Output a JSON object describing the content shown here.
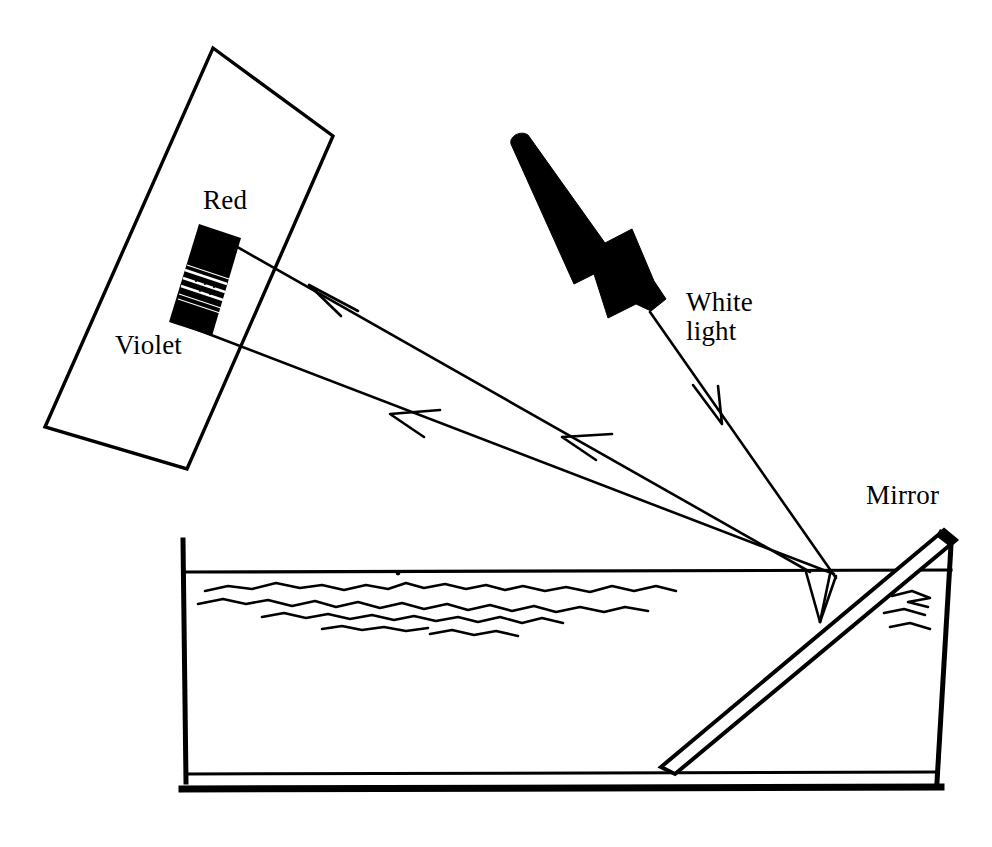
{
  "figure": {
    "kind": "optics-diagram",
    "background_color": "#ffffff",
    "ink_color": "#000000",
    "width": 992,
    "height": 847
  },
  "labels": {
    "red": "Red",
    "violet": "Violet",
    "white_light": "White\nlight",
    "white_light_line1": "White",
    "white_light_line2": "light",
    "mirror": "Mirror"
  },
  "components": {
    "screen": {
      "name": "screen-card",
      "description": "tilted blank rectangular screen at upper left",
      "corners": [
        [
          213,
          48
        ],
        [
          333,
          136
        ],
        [
          187,
          469
        ],
        [
          45,
          427
        ]
      ],
      "stroke_width": 3
    },
    "spectrum": {
      "name": "spectrum-band",
      "description": "dark band on the screen showing the dispersed spectrum from Red at top to Violet at bottom",
      "corners": [
        [
          200,
          226
        ],
        [
          240,
          239
        ],
        [
          211,
          334
        ],
        [
          170,
          321
        ]
      ],
      "fill": "#000000",
      "striations": 5,
      "top_end_label": "Red",
      "bottom_end_label": "Violet"
    },
    "lamp": {
      "name": "light-source-arrow",
      "description": "solid black tapered beam arrow representing the incident white light source",
      "tail": [
        524,
        138
      ],
      "head": [
        650,
        316
      ],
      "fill": "#000000"
    },
    "tank": {
      "name": "water-tank",
      "description": "rectangular container of water drawn in side view",
      "left_wall_x": 182,
      "right_wall_top_x": 950,
      "right_wall_bottom_x": 936,
      "rim_y": 540,
      "water_surface_y": 572,
      "bottom_inner_y": 774,
      "bottom_outer_y": 791,
      "stroke_width": 4
    },
    "water": {
      "name": "water-surface-ripples",
      "description": "hand-drawn wavy lines just below the water surface line",
      "ripple_rows": 4
    },
    "mirror": {
      "name": "mirror-slab",
      "description": "flat mirror leaning at about 45 degrees inside the tank, top edge above the water line",
      "top": [
        948,
        533
      ],
      "bottom": [
        663,
        768
      ],
      "thickness": 12
    }
  },
  "rays": [
    {
      "name": "incident-white-light-ray",
      "from": [
        650,
        316
      ],
      "to": [
        828,
        572
      ],
      "arrow_at": [
        718,
        418
      ],
      "arrow_direction": "down-right",
      "color": "#000000"
    },
    {
      "name": "refracted-ray-in-water",
      "from": [
        828,
        572
      ],
      "to": [
        822,
        620
      ],
      "color": "#000000"
    },
    {
      "name": "reflected-ray-to-surface-upper",
      "from": [
        822,
        620
      ],
      "to": [
        808,
        572
      ],
      "color": "#000000"
    },
    {
      "name": "emergent-red-ray",
      "from": [
        808,
        572
      ],
      "to": [
        202,
        226
      ],
      "arrow_at": [
        312,
        287
      ],
      "arrow_direction": "up-left",
      "terminates_at": "Red end of spectrum",
      "color": "#000000"
    },
    {
      "name": "emergent-violet-ray",
      "from": [
        828,
        572
      ],
      "to": [
        176,
        318
      ],
      "arrow_at_1": [
        565,
        437
      ],
      "arrow_at_2": [
        393,
        414
      ],
      "arrow_direction": "up-left",
      "terminates_at": "Violet end of spectrum",
      "color": "#000000"
    }
  ],
  "colors": {
    "ink": "#000000",
    "paper": "#ffffff"
  }
}
